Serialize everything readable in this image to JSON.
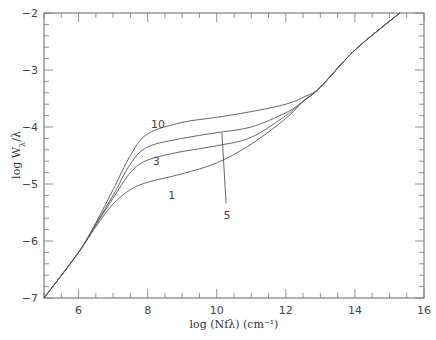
{
  "chart_data": {
    "type": "line",
    "title": "",
    "xlabel": "log (Nfλ) (cm⁻¹)",
    "ylabel": "log W_λ/λ",
    "xlim": [
      5,
      16
    ],
    "ylim": [
      -7,
      -2
    ],
    "xticks": [
      6,
      8,
      10,
      12,
      14,
      16
    ],
    "yticks": [
      -7,
      -6,
      -5,
      -4,
      -3,
      -2
    ],
    "grid": false,
    "series": [
      {
        "name": "1",
        "x": [
          5,
          6,
          6.5,
          7,
          7.5,
          8,
          9,
          10,
          11,
          12,
          12.5,
          13,
          14,
          15.3
        ],
        "y": [
          -7,
          -6.2,
          -5.75,
          -5.35,
          -5.1,
          -4.97,
          -4.82,
          -4.63,
          -4.3,
          -3.85,
          -3.55,
          -3.3,
          -2.65,
          -2.0
        ]
      },
      {
        "name": "3",
        "x": [
          5,
          6,
          6.5,
          7,
          7.5,
          8,
          9,
          10,
          11,
          12,
          12.5,
          13,
          14,
          15.3
        ],
        "y": [
          -7,
          -6.2,
          -5.72,
          -5.25,
          -4.8,
          -4.58,
          -4.43,
          -4.33,
          -4.18,
          -3.8,
          -3.55,
          -3.3,
          -2.65,
          -2.0
        ]
      },
      {
        "name": "5",
        "x": [
          5,
          6,
          6.5,
          7,
          7.5,
          8,
          9,
          10,
          11,
          12,
          12.5,
          13,
          14,
          15.3
        ],
        "y": [
          -7,
          -6.2,
          -5.7,
          -5.2,
          -4.65,
          -4.35,
          -4.2,
          -4.1,
          -4.0,
          -3.75,
          -3.55,
          -3.3,
          -2.65,
          -2.0
        ]
      },
      {
        "name": "10",
        "x": [
          5,
          6,
          6.5,
          7,
          7.5,
          8,
          9,
          10,
          11,
          12,
          12.5,
          13,
          14,
          15.3
        ],
        "y": [
          -7,
          -6.2,
          -5.68,
          -5.1,
          -4.5,
          -4.12,
          -3.92,
          -3.83,
          -3.73,
          -3.6,
          -3.48,
          -3.3,
          -2.65,
          -2.0
        ]
      }
    ],
    "annotations": [
      {
        "text": "10",
        "x": 8.3,
        "y": -3.95
      },
      {
        "text": "3",
        "x": 8.25,
        "y": -4.6
      },
      {
        "text": "1",
        "x": 8.7,
        "y": -5.2
      },
      {
        "text": "5",
        "x": 10.3,
        "y": -5.55,
        "pointer_to": {
          "x": 10.15,
          "y": -4.1
        }
      }
    ]
  }
}
